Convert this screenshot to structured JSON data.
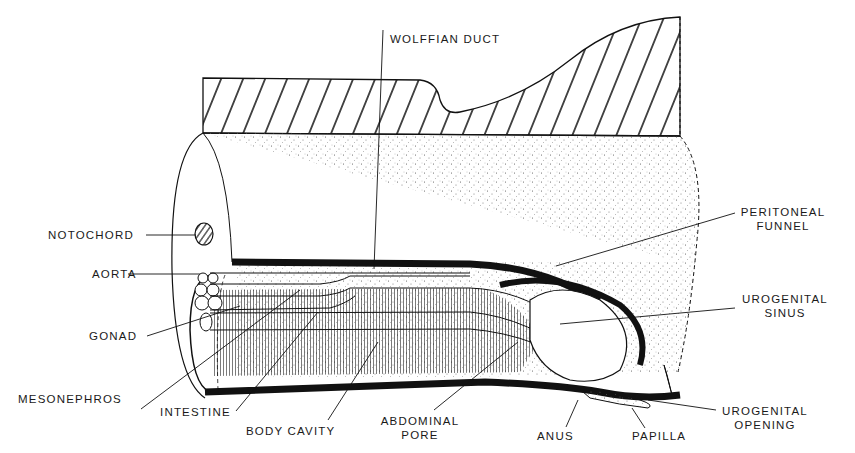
{
  "diagram": {
    "labels": {
      "wolffian_duct": "WOLFFIAN DUCT",
      "notochord": "NOTOCHORD",
      "aorta": "AORTA",
      "gonad": "GONAD",
      "mesonephros": "MESONEPHROS",
      "intestine": "INTESTINE",
      "body_cavity": "BODY CAVITY",
      "abdominal_pore_1": "ABDOMINAL",
      "abdominal_pore_2": "PORE",
      "anus": "ANUS",
      "papilla": "PAPILLA",
      "peritoneal_funnel_1": "PERITONEAL",
      "peritoneal_funnel_2": "FUNNEL",
      "urogenital_sinus_1": "UROGENITAL",
      "urogenital_sinus_2": "SINUS",
      "urogenital_opening_1": "UROGENITAL",
      "urogenital_opening_2": "OPENING"
    }
  }
}
